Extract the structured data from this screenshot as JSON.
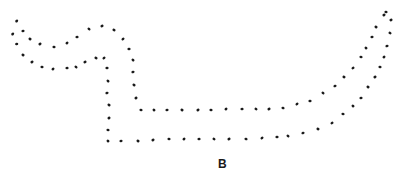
{
  "figure": {
    "label": "B",
    "dot_color": "#1a1a1a",
    "background": "#ffffff",
    "contours": [
      {
        "name": "upper-contour",
        "points": [
          [
            16.7,
            21
          ],
          [
            23,
            31
          ],
          [
            30,
            39
          ],
          [
            40,
            44
          ],
          [
            54,
            47
          ],
          [
            67,
            43
          ],
          [
            77,
            37
          ],
          [
            89,
            29
          ],
          [
            102,
            26
          ],
          [
            114,
            30
          ],
          [
            123,
            39
          ],
          [
            129,
            49
          ],
          [
            133,
            60
          ],
          [
            133,
            72
          ],
          [
            134,
            85
          ],
          [
            136,
            98
          ],
          [
            141,
            110
          ],
          [
            154,
            110
          ],
          [
            167,
            110
          ],
          [
            182,
            110
          ],
          [
            198,
            110
          ],
          [
            211,
            110
          ],
          [
            226,
            109
          ],
          [
            242,
            109
          ],
          [
            256,
            109
          ],
          [
            269,
            109
          ],
          [
            283,
            108
          ],
          [
            297,
            104
          ],
          [
            310,
            101
          ],
          [
            323,
            93
          ],
          [
            335,
            86
          ],
          [
            344,
            77
          ],
          [
            353,
            68
          ],
          [
            361,
            57
          ],
          [
            366,
            48
          ],
          [
            372,
            37
          ],
          [
            376,
            27
          ],
          [
            384,
            15
          ],
          [
            386,
            12
          ]
        ]
      },
      {
        "name": "lower-contour",
        "points": [
          [
            12.7,
            34
          ],
          [
            16.7,
            44
          ],
          [
            23,
            55
          ],
          [
            32,
            62
          ],
          [
            42,
            67
          ],
          [
            53,
            69
          ],
          [
            67,
            68
          ],
          [
            76,
            67
          ],
          [
            85,
            62
          ],
          [
            96,
            58
          ],
          [
            104,
            58
          ],
          [
            107,
            68
          ],
          [
            108,
            81
          ],
          [
            107,
            93
          ],
          [
            109,
            105
          ],
          [
            109,
            118
          ],
          [
            108,
            130
          ],
          [
            108,
            141
          ],
          [
            121,
            141
          ],
          [
            138,
            141
          ],
          [
            153,
            140
          ],
          [
            169,
            139
          ],
          [
            184,
            139
          ],
          [
            199,
            139
          ],
          [
            214,
            139
          ],
          [
            229,
            139
          ],
          [
            246,
            139
          ],
          [
            262,
            138
          ],
          [
            277,
            137
          ],
          [
            288,
            136
          ],
          [
            303,
            133
          ],
          [
            318,
            129
          ],
          [
            332,
            123
          ],
          [
            343,
            114
          ],
          [
            353,
            106
          ],
          [
            361,
            98
          ],
          [
            368,
            87
          ],
          [
            375,
            77
          ],
          [
            380,
            67
          ],
          [
            384,
            57
          ],
          [
            387,
            46
          ],
          [
            390,
            33
          ],
          [
            391,
            20
          ]
        ]
      }
    ]
  }
}
